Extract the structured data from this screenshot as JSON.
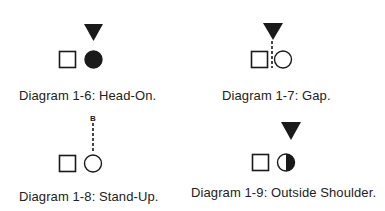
{
  "diagrams": [
    {
      "id": "1-6",
      "caption": "Diagram 1-6: Head-On.",
      "marker": "triangle",
      "circle_fill": "full"
    },
    {
      "id": "1-7",
      "caption": "Diagram 1-7: Gap.",
      "marker": "triangle-dashed",
      "circle_fill": "none"
    },
    {
      "id": "1-8",
      "caption": "Diagram 1-8: Stand-Up.",
      "marker": "B-dashed",
      "marker_label": "B",
      "circle_fill": "none"
    },
    {
      "id": "1-9",
      "caption": "Diagram 1-9: Outside Shoulder.",
      "marker": "triangle",
      "circle_fill": "right-half"
    }
  ],
  "colors": {
    "ink": "#1a1a1a",
    "background": "#ffffff"
  }
}
